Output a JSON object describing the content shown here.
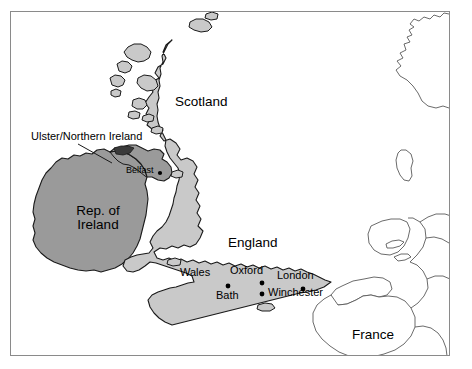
{
  "figure": {
    "type": "map",
    "title_visible": false
  },
  "colors": {
    "britain_fill": "#c9c9c9",
    "ireland_fill": "#9a9a9a",
    "sea_fill": "#ffffff",
    "continent_fill": "#ffffff",
    "coastline_stroke": "#1a1a1a",
    "continent_stroke": "#5a5a5a",
    "frame_stroke": "#8a8a8a",
    "label_text": "#000000"
  },
  "frame": {
    "x": 10,
    "y": 11,
    "width": 440,
    "height": 345,
    "stroke_width": 1
  },
  "regions": [
    {
      "name": "Scotland",
      "label": "Scotland",
      "fill": "britain_fill",
      "label_x": 208,
      "label_y": 104,
      "font": "country"
    },
    {
      "name": "England",
      "label": "England",
      "fill": "britain_fill",
      "label_x": 257,
      "label_y": 244,
      "font": "country"
    },
    {
      "name": "Wales",
      "label": "Wales",
      "fill": "britain_fill",
      "label_x": 200,
      "label_y": 274,
      "font": "city"
    },
    {
      "name": "Republic of Ireland",
      "label_lines": [
        "Rep. of",
        "Ireland"
      ],
      "fill": "ireland_fill",
      "label_x": 97,
      "label_y": 212,
      "font": "country"
    },
    {
      "name": "Ulster / Northern Ireland",
      "label": "Ulster/Northern Ireland",
      "fill": "ireland_fill",
      "label_x": 31,
      "label_y": 131,
      "font": "callout",
      "has_leader_line": true
    },
    {
      "name": "France",
      "label": "France",
      "fill": "continent_fill",
      "label_x": 352,
      "label_y": 329,
      "font": "country"
    }
  ],
  "cities": [
    {
      "name": "Belfast",
      "label": "Belfast",
      "dot_x": 160,
      "dot_y": 173,
      "label_x": 126,
      "label_y": 167,
      "label_side": "left",
      "font": "small"
    },
    {
      "name": "Oxford",
      "label": "Oxford",
      "dot_x": 262,
      "dot_y": 283,
      "label_x": 233,
      "label_y": 267,
      "label_side": "above",
      "font": "city"
    },
    {
      "name": "London",
      "label": "London",
      "dot_x": 303,
      "dot_y": 289,
      "label_x": 277,
      "label_y": 272,
      "label_side": "above",
      "font": "city"
    },
    {
      "name": "Bath",
      "label": "Bath",
      "dot_x": 228,
      "dot_y": 286,
      "label_x": 216,
      "label_y": 290,
      "label_side": "below",
      "font": "city"
    },
    {
      "name": "Winchester",
      "label": "Winchester",
      "dot_x": 262,
      "dot_y": 294,
      "label_x": 268,
      "label_y": 288,
      "label_side": "right",
      "font": "city"
    }
  ],
  "callout": {
    "text": "Ulster/Northern Ireland",
    "leader_from_x": 78,
    "leader_from_y": 144,
    "leader_to_x": 112,
    "leader_to_y": 163
  }
}
